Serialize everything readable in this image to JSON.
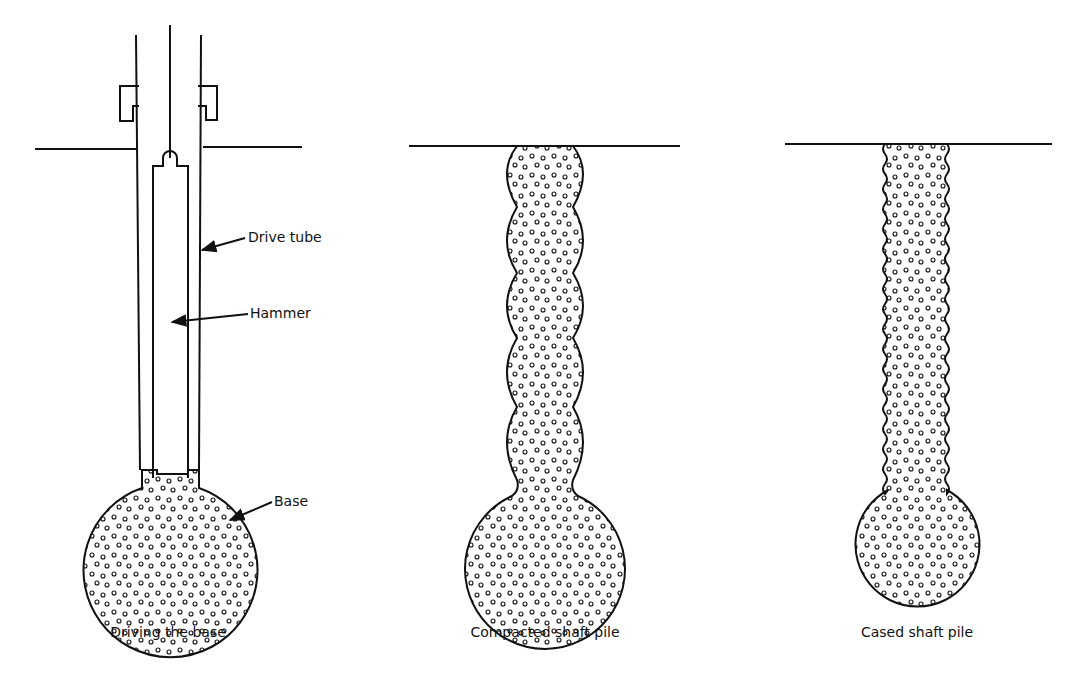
{
  "figure": {
    "panels": [
      {
        "id": "driving-base",
        "caption": "Driving the base",
        "labels": {
          "drive_tube": "Drive tube",
          "hammer": "Hammer",
          "base": "Base"
        }
      },
      {
        "id": "compacted-shaft",
        "caption": "Compacted shaft pile"
      },
      {
        "id": "cased-shaft",
        "caption": "Cased shaft pile"
      }
    ]
  },
  "colors": {
    "line": "#111111",
    "background": "#ffffff"
  }
}
